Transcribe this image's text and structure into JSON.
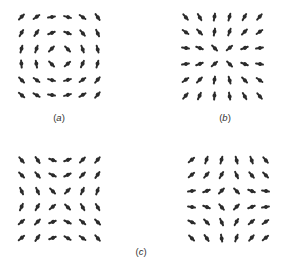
{
  "figure": {
    "panels": [
      {
        "id": "a",
        "description": "vortex (tangential) director field",
        "cols_x": [
          21,
          36,
          51,
          67,
          82,
          97
        ],
        "rows_y": [
          17,
          33,
          49,
          64,
          80,
          95
        ],
        "angles_deg": [
          [
            45,
            35,
            10,
            -15,
            -35,
            -55
          ],
          [
            60,
            55,
            20,
            -20,
            -50,
            -65
          ],
          [
            75,
            70,
            45,
            -45,
            -70,
            -75
          ],
          [
            95,
            100,
            -45,
            40,
            65,
            75
          ],
          [
            -45,
            -35,
            -15,
            15,
            35,
            50
          ],
          [
            -40,
            -30,
            -10,
            15,
            30,
            50
          ]
        ]
      },
      {
        "id": "b",
        "description": "radial (aster) director field",
        "cols_x": [
          185,
          199,
          214,
          229,
          244,
          259
        ],
        "rows_y": [
          17,
          32,
          48,
          64,
          80,
          96
        ],
        "angles_deg": [
          [
            -50,
            -60,
            80,
            75,
            60,
            50
          ],
          [
            -35,
            -45,
            80,
            70,
            45,
            35
          ],
          [
            -10,
            -20,
            -45,
            40,
            20,
            10
          ],
          [
            10,
            20,
            40,
            -45,
            -20,
            -10
          ],
          [
            35,
            45,
            80,
            -75,
            -45,
            -35
          ],
          [
            50,
            65,
            85,
            -80,
            -60,
            -50
          ]
        ]
      },
      {
        "id": "c-left",
        "description": "saddle-like director field (left)",
        "cols_x": [
          21,
          37,
          52,
          67,
          82,
          97
        ],
        "rows_y": [
          160,
          175,
          191,
          207,
          222,
          238
        ],
        "angles_deg": [
          [
            -50,
            -55,
            -20,
            20,
            45,
            50
          ],
          [
            -45,
            -50,
            -25,
            25,
            45,
            55
          ],
          [
            -65,
            -65,
            -45,
            45,
            65,
            70
          ],
          [
            65,
            60,
            40,
            -45,
            -60,
            -60
          ],
          [
            40,
            45,
            20,
            -25,
            -40,
            -45
          ],
          [
            40,
            55,
            20,
            -30,
            -35,
            -50
          ]
        ]
      },
      {
        "id": "c-right",
        "description": "saddle-like director field (right)",
        "cols_x": [
          191,
          206,
          221,
          236,
          251,
          265
        ],
        "rows_y": [
          160,
          175,
          191,
          207,
          222,
          238
        ],
        "angles_deg": [
          [
            40,
            70,
            75,
            -75,
            -70,
            -50
          ],
          [
            40,
            50,
            60,
            -65,
            -50,
            -45
          ],
          [
            10,
            20,
            45,
            -45,
            -20,
            -10
          ],
          [
            -10,
            -20,
            -50,
            45,
            20,
            10
          ],
          [
            -25,
            -45,
            -65,
            60,
            40,
            35
          ],
          [
            -45,
            -55,
            -80,
            70,
            50,
            40
          ]
        ]
      }
    ],
    "labels": [
      {
        "open": "(",
        "letter": "a",
        "close": ")",
        "x": 59,
        "y": 112
      },
      {
        "open": "(",
        "letter": "b",
        "close": ")",
        "x": 225,
        "y": 112
      },
      {
        "open": "(",
        "letter": "c",
        "close": ")",
        "x": 141,
        "y": 246
      }
    ],
    "colors": {
      "rod": "#2b2b2b",
      "label": "#333333",
      "background": "#ffffff"
    }
  }
}
